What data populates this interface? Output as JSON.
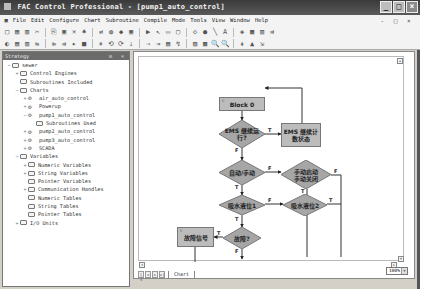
{
  "window": {
    "title": "FAC Control Professional - [pump1_auto_control]",
    "buttons": [
      "minimize",
      "maximize",
      "close"
    ]
  },
  "menubar": {
    "items": [
      "File",
      "Edit",
      "Configure",
      "Chart",
      "Subroutine",
      "Compile",
      "Mode",
      "Tools",
      "View",
      "Window",
      "Help"
    ],
    "mdi_controls": "- □ ×"
  },
  "toolbar1": {
    "icons": [
      "new-icon",
      "open-icon",
      "save-icon",
      "cut-icon",
      "copy-icon",
      "paste-icon",
      "delete-icon",
      "find-icon",
      "replace-icon",
      "compile-icon",
      "download-icon",
      "debug-icon",
      "run-icon",
      "select-arrow-icon",
      "action-block-icon",
      "oip-block-icon",
      "condition-icon",
      "continue-icon",
      "connect-icon",
      "text-icon",
      "color-icon",
      "grid-icon",
      "align-icon",
      "snap-icon"
    ],
    "glyphs": [
      "▢",
      "▤",
      "▥",
      "✂",
      "⎘",
      "▣",
      "✕",
      "♠",
      "⇄",
      "◍",
      "◆",
      "▣",
      "▶",
      "↖",
      "▭",
      "▢",
      "◇",
      "●",
      "╲",
      "A",
      "◈",
      "▦",
      "▥",
      "⇉"
    ]
  },
  "toolbar2": {
    "glyphs": [
      "◐",
      "▤",
      "▥",
      "⇆",
      "⇇",
      "⇉",
      "▸",
      "■",
      "⏸",
      "⟲",
      "⟳",
      "⇣",
      "⇢",
      "⇥",
      "▤",
      "↯",
      "▨",
      "▩",
      "🔍",
      "🔍",
      "⇞",
      "▲",
      "⇲"
    ]
  },
  "strategy_panel": {
    "title": "Strategy",
    "panel_buttons": "⊡ ×",
    "tree": [
      {
        "label": "sewer",
        "level": 0,
        "expander": "−",
        "icon": "folder"
      },
      {
        "label": "Control Engines",
        "level": 1,
        "expander": "+",
        "icon": "folder"
      },
      {
        "label": "Subroutines Included",
        "level": 1,
        "expander": "",
        "icon": "folder"
      },
      {
        "label": "Charts",
        "level": 1,
        "expander": "−",
        "icon": "folder"
      },
      {
        "label": "air_auto_control",
        "level": 2,
        "expander": "+",
        "icon": "chart"
      },
      {
        "label": "Powerup",
        "level": 2,
        "expander": "+",
        "icon": "chart"
      },
      {
        "label": "pump1_auto_control",
        "level": 2,
        "expander": "−",
        "icon": "chart"
      },
      {
        "label": "Subroutines Used",
        "level": 3,
        "expander": "",
        "icon": "folder"
      },
      {
        "label": "pump2_auto_control",
        "level": 2,
        "expander": "+",
        "icon": "chart"
      },
      {
        "label": "pump3_auto_control",
        "level": 2,
        "expander": "+",
        "icon": "chart"
      },
      {
        "label": "SCADA",
        "level": 2,
        "expander": "+",
        "icon": "chart"
      },
      {
        "label": "Variables",
        "level": 1,
        "expander": "−",
        "icon": "folder"
      },
      {
        "label": "Numeric Variables",
        "level": 2,
        "expander": "+",
        "icon": "folder"
      },
      {
        "label": "String Variables",
        "level": 2,
        "expander": "+",
        "icon": "folder"
      },
      {
        "label": "Pointer Variables",
        "level": 2,
        "expander": "",
        "icon": "folder"
      },
      {
        "label": "Communication Handles",
        "level": 2,
        "expander": "+",
        "icon": "folder"
      },
      {
        "label": "Numeric Tables",
        "level": 2,
        "expander": "",
        "icon": "folder"
      },
      {
        "label": "String Tables",
        "level": 2,
        "expander": "",
        "icon": "folder"
      },
      {
        "label": "Pointer Tables",
        "level": 2,
        "expander": "",
        "icon": "folder"
      },
      {
        "label": "I/O Units",
        "level": 1,
        "expander": "+",
        "icon": "folder"
      }
    ]
  },
  "flowchart": {
    "blocks": [
      {
        "id": "block0",
        "type": "action",
        "label": "Block 0",
        "index": "0"
      },
      {
        "id": "cond-ems",
        "type": "condition",
        "label": "EMS 继续运行?",
        "line1": "EMS 继续运",
        "line2": "行?"
      },
      {
        "id": "ems-record",
        "type": "action",
        "label": "EMS 继续计数状态",
        "line1": "EMS 继续计",
        "line2": "数状态"
      },
      {
        "id": "cond-auto",
        "type": "condition",
        "label": "自动/手动"
      },
      {
        "id": "cond-manual",
        "type": "condition",
        "label": "手动启动/手动关闭",
        "line1": "手动启动",
        "line2": "手动关闭"
      },
      {
        "id": "cond-level1",
        "type": "condition",
        "label": "吸水液位1"
      },
      {
        "id": "cond-level2",
        "type": "condition",
        "label": "吸水液位2"
      },
      {
        "id": "fault-signal",
        "type": "action",
        "label": "故障信号"
      },
      {
        "id": "cond-fault",
        "type": "condition",
        "label": "故障?"
      }
    ],
    "branch_labels": {
      "true": "T",
      "false": "F"
    }
  },
  "chart_tabs": {
    "nav_buttons": [
      "|◂",
      "◂",
      "▸",
      "▸|"
    ],
    "active_tab": "Chart"
  },
  "zoom_level": "100%"
}
